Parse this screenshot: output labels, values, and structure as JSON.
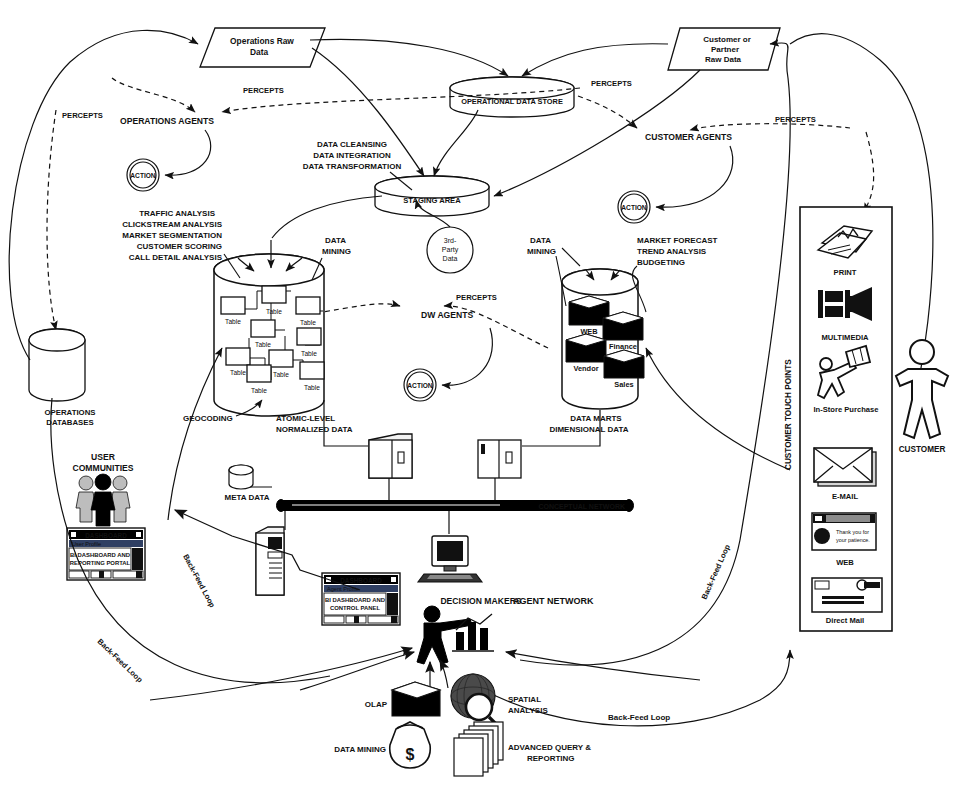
{
  "diagram": {
    "sources": {
      "operations_raw_data": "Operations Raw\nData",
      "operations_raw_data_line1": "Operations Raw",
      "operations_raw_data_line2": "Data",
      "customer_partner_raw_data_line1": "Customer or",
      "customer_partner_raw_data_line2": "Partner",
      "customer_partner_raw_data_line3": "Raw Data",
      "third_party_line1": "3rd-",
      "third_party_line2": "Party",
      "third_party_line3": "Data"
    },
    "stores": {
      "operational_data_store": "OPERATIONAL DATA STORE",
      "staging_area": "STAGING AREA",
      "operations_databases_line1": "OPERATIONS",
      "operations_databases_line2": "DATABASES",
      "meta_data": "META DATA",
      "atomic_line1": "ATOMIC-LEVEL",
      "atomic_line2": "NORMALIZED DATA",
      "marts_line1": "DATA MARTS",
      "marts_line2": "DIMENSIONAL DATA"
    },
    "agents": {
      "operations_agents": "OPERATIONS AGENTS",
      "customer_agents": "CUSTOMER AGENTS",
      "dw_agents": "DW AGENTS",
      "action": "ACTION",
      "percepts": "PERCEPTS",
      "agent_network": "AGENT NETWORK"
    },
    "etl_labels": {
      "line1": "DATA CLEANSING",
      "line2": "DATA INTEGRATION",
      "line3": "DATA TRANSFORMATION"
    },
    "dw_analytics": {
      "line1": "TRAFFIC ANALYSIS",
      "line2": "CLICKSTREAM ANALYSIS",
      "line3": "MARKET SEGMENTATION",
      "line4": "CUSTOMER SCORING",
      "line5": "CALL DETAIL ANALYSIS"
    },
    "mart_analytics": {
      "line1": "MARKET FORECAST",
      "line2": "TREND ANALYSIS",
      "line3": "BUDGETING"
    },
    "data_mining_left_l1": "DATA",
    "data_mining_left_l2": "MINING",
    "data_mining_right_l1": "DATA",
    "data_mining_right_l2": "MINING",
    "geocoding": "GEOCODING",
    "tables": [
      "Table",
      "Table",
      "Table",
      "Table",
      "Table",
      "Table",
      "Table",
      "Table",
      "Table"
    ],
    "marts": [
      "WEB",
      "Finance",
      "Vendor",
      "Sales"
    ],
    "network": {
      "conceptual_network": "CONCEPTUAL NETWORK"
    },
    "users": {
      "user_communities_l1": "USER",
      "user_communities_l2": "COMMUNITIES",
      "decision_makers": "DECISION MAKERS"
    },
    "dashboards": [
      {
        "titlebar": "DASHBOARD",
        "subtitle": "User Profile",
        "body_l1": "BI DASHBOARD AND",
        "body_l2": "REPORTING PORTAL"
      },
      {
        "titlebar": "DASHBOARD",
        "subtitle": "Agent Profile",
        "body_l1": "BI DASHBOARD AND",
        "body_l2": "CONTROL PANEL"
      }
    ],
    "bi_tools": [
      {
        "label": "OLAP",
        "icon": "cube-icon"
      },
      {
        "label": "DATA MINING",
        "icon": "money-bag-icon"
      },
      {
        "label_l1": "SPATIAL",
        "label_l2": "ANALYSIS",
        "icon": "magnifier-globe-icon"
      },
      {
        "label_l1": "ADVANCED QUERY &",
        "label_l2": "REPORTING",
        "icon": "stacked-pages-icon"
      }
    ],
    "touch_points": {
      "axis_label": "CUSTOMER TOUCH POINTS",
      "items": [
        {
          "label": "PRINT",
          "icon": "newspaper-icon"
        },
        {
          "label": "MULTIMEDIA",
          "icon": "film-projector-icon"
        },
        {
          "label": "In-Store Purchase",
          "icon": "shopper-icon"
        },
        {
          "label": "E-MAIL",
          "icon": "envelope-icon"
        },
        {
          "label": "WEB",
          "icon": "browser-window-icon",
          "window_text_l1": "Thank you for",
          "window_text_l2": "your patience."
        },
        {
          "label": "Direct Mail",
          "icon": "mail-piece-icon"
        }
      ]
    },
    "customer": "CUSTOMER",
    "back_feed_loops": [
      "Back-Feed Loop",
      "Back-Feed Loop",
      "Back-Feed Loop",
      "Back-Feed Loop"
    ],
    "colors": {
      "ink": "#111111",
      "paper": "#ffffff",
      "fill_dark": "#000000"
    }
  }
}
